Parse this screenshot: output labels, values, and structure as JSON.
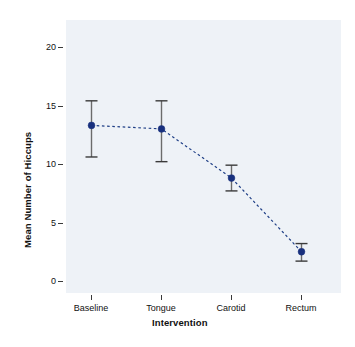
{
  "chart_data": {
    "type": "line",
    "title": "",
    "subtitle": "",
    "xlabel": "Intervention",
    "ylabel": "Mean Number of Hiccups",
    "categories": [
      "Baseline",
      "Tongue",
      "Carotid",
      "Rectum"
    ],
    "values": [
      13.3,
      13.0,
      8.8,
      2.5
    ],
    "error_low": [
      10.6,
      10.2,
      7.7,
      1.7
    ],
    "error_high": [
      15.4,
      15.4,
      9.9,
      3.2
    ],
    "series": [
      {
        "name": "Mean Number of Hiccups",
        "values": [
          13.3,
          13.0,
          8.8,
          2.5
        ]
      }
    ],
    "ylim": [
      -0.9,
      22.5
    ],
    "yticks": [
      0,
      5,
      10,
      15,
      20
    ],
    "ytick_labels": [
      "0",
      "5",
      "10",
      "15",
      "20"
    ],
    "xtick_labels": [
      "Baseline",
      "Tongue",
      "Carotid",
      "Rectum"
    ],
    "grid": false,
    "legend": "none",
    "point_style": "filled-circle",
    "line_style": "dashed",
    "error_bars": "vertical-capped",
    "colors": {
      "point": "#18307e",
      "line": "#1f3f86",
      "error": "#6b6b6b",
      "panel_background": "#eef2f7",
      "figure_background": "#ffffff",
      "text": "#111111"
    }
  },
  "axes": {
    "y_tick_0": "0",
    "y_tick_1": "5",
    "y_tick_2": "10",
    "y_tick_3": "15",
    "y_tick_4": "20",
    "x_tick_0": "Baseline",
    "x_tick_1": "Tongue",
    "x_tick_2": "Carotid",
    "x_tick_3": "Rectum",
    "x_title": "Intervention",
    "y_title": "Mean Number of Hiccups"
  }
}
